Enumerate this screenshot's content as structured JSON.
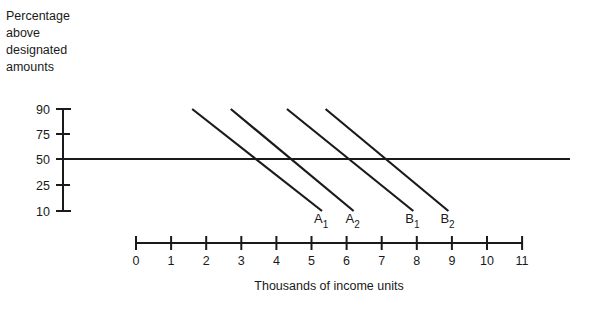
{
  "chart_data": {
    "type": "line",
    "title": "",
    "ylabel_lines": [
      "Percentage",
      "above",
      "designated",
      "amounts"
    ],
    "xlabel": "Thousands of income units",
    "y_ticks": [
      90,
      75,
      50,
      25,
      10
    ],
    "x_ticks": [
      0,
      1,
      2,
      3,
      4,
      5,
      6,
      7,
      8,
      9,
      10,
      11
    ],
    "xlim": [
      0,
      11
    ],
    "ylim": [
      10,
      90
    ],
    "grid": false,
    "reference_line": {
      "y": 50,
      "x_start": -2,
      "x_end": 12.3
    },
    "series": [
      {
        "name": "A",
        "sub": "1",
        "points": [
          [
            1.6,
            90
          ],
          [
            5.3,
            10
          ]
        ],
        "crosses_50_at": 3.6
      },
      {
        "name": "A",
        "sub": "2",
        "points": [
          [
            2.7,
            90
          ],
          [
            6.2,
            10
          ]
        ],
        "crosses_50_at": 4.6
      },
      {
        "name": "B",
        "sub": "1",
        "points": [
          [
            4.3,
            90
          ],
          [
            7.9,
            10
          ]
        ],
        "crosses_50_at": 6.2
      },
      {
        "name": "B",
        "sub": "2",
        "points": [
          [
            5.4,
            90
          ],
          [
            8.9,
            10
          ]
        ],
        "crosses_50_at": 7.3
      }
    ],
    "line_color": "#1a1a1a"
  }
}
